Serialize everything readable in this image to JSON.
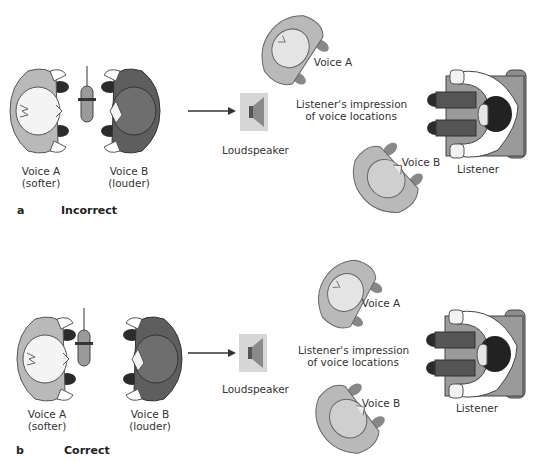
{
  "panels": [
    {
      "id": "a",
      "letter": "a",
      "title": "Incorrect",
      "recording": {
        "voice_a": {
          "name": "Voice A",
          "note": "(softer)"
        },
        "voice_b": {
          "name": "Voice B",
          "note": "(louder)"
        },
        "microphone_position": "between speakers, centered"
      },
      "loudspeaker_label": "Loudspeaker",
      "impression_label_line1": "Listener's impression",
      "impression_label_line2": "of voice locations",
      "perceived": {
        "voice_a": "Voice A",
        "voice_b": "Voice B"
      },
      "listener_label": "Listener"
    },
    {
      "id": "b",
      "letter": "b",
      "title": "Correct",
      "recording": {
        "voice_a": {
          "name": "Voice A",
          "note": "(softer)"
        },
        "voice_b": {
          "name": "Voice B",
          "note": "(louder)"
        },
        "microphone_position": "close to Voice A"
      },
      "loudspeaker_label": "Loudspeaker",
      "impression_label_line1": "Listener's impression",
      "impression_label_line2": "of voice locations",
      "perceived": {
        "voice_a": "Voice A",
        "voice_b": "Voice B"
      },
      "listener_label": "Listener"
    }
  ],
  "colors": {
    "voice_a_body": "#b9b9b9",
    "voice_b_body": "#5e5e5e",
    "feet": "#2b2b2b",
    "head_light": "#f4f4f4",
    "listener_hair": "#222222",
    "chair": "#8c8c8c",
    "speaker_box": "#d6d6d6"
  }
}
